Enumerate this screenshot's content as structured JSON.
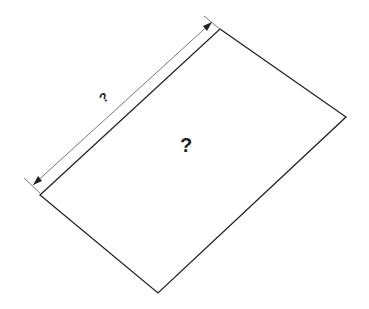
{
  "diagram": {
    "shape": "rectangle (rotated)",
    "dimension_label": "?",
    "area_label": "?",
    "colors": {
      "outline": "#222222",
      "dimension_line": "#555555",
      "background": "#ffffff"
    },
    "vertices": [
      [
        220,
        29
      ],
      [
        346,
        117
      ],
      [
        158,
        293
      ],
      [
        40,
        195
      ]
    ],
    "dimension_line": {
      "from": [
        32,
        184
      ],
      "to": [
        211,
        20
      ]
    }
  }
}
